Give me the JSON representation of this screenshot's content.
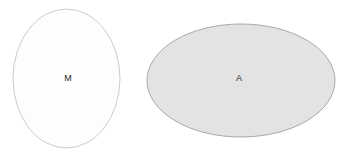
{
  "canvas": {
    "width": 353,
    "height": 158,
    "background_color": "#ffffff"
  },
  "diagram": {
    "type": "ellipse-set-diagram",
    "shapes": [
      {
        "id": "ellipse-m",
        "label": "M",
        "orientation": "vertical",
        "cx": 66.5,
        "cy": 78.5,
        "rx": 53.5,
        "ry": 69.5,
        "fill_color": "#fdfdfd",
        "stroke_color": "#cccccc",
        "stroke_width": 1,
        "label_x": 68,
        "label_y": 79,
        "label_color": "#1f1f1f"
      },
      {
        "id": "ellipse-a",
        "label": "A",
        "orientation": "horizontal",
        "cx": 241,
        "cy": 80.5,
        "rx": 94,
        "ry": 56.5,
        "fill_color": "#e3e3e3",
        "stroke_color": "#a9a9a9",
        "stroke_width": 1,
        "label_x": 239,
        "label_y": 79,
        "label_color": "#1f1f1f"
      }
    ]
  }
}
